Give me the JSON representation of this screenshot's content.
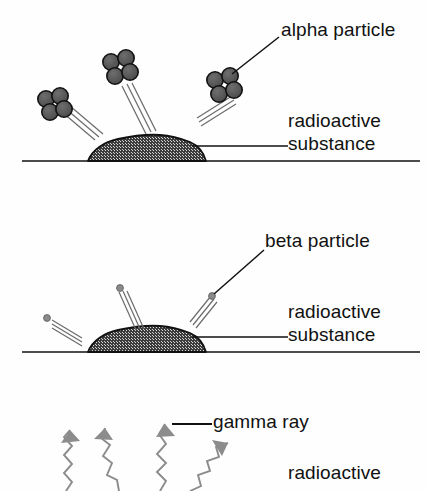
{
  "diagram": {
    "background_color": "#ffffff",
    "ink_color": "#111111",
    "particle_fill": "#5a5a5a",
    "particle_stroke": "#111111",
    "gamma_color": "#8c8c8c",
    "mound_fill": "#3a3a3a",
    "motion_line_color": "#6b6b6b"
  },
  "panels": [
    {
      "id": "alpha",
      "label": "alpha particle",
      "substance_label_line1": "radioactive",
      "substance_label_line2": "substance",
      "particle_type": "alpha",
      "particle_description": "cluster-of-four-nucleons",
      "particle_count": 3
    },
    {
      "id": "beta",
      "label": "beta particle",
      "substance_label_line1": "radioactive",
      "substance_label_line2": "substance",
      "particle_type": "beta",
      "particle_description": "single-small-dot",
      "particle_count": 3
    },
    {
      "id": "gamma",
      "label": "gamma ray",
      "substance_label_line1": "radioactive",
      "substance_label_line2": "",
      "particle_type": "gamma",
      "particle_description": "zigzag-wave-with-arrowhead",
      "particle_count": 4
    }
  ],
  "labels": {
    "alpha_particle": "alpha particle",
    "beta_particle": "beta particle",
    "gamma_ray": "gamma ray",
    "radioactive_1": "radioactive",
    "substance_1": "substance",
    "radioactive_2": "radioactive",
    "substance_2": "substance",
    "radioactive_3": "radioactive"
  }
}
